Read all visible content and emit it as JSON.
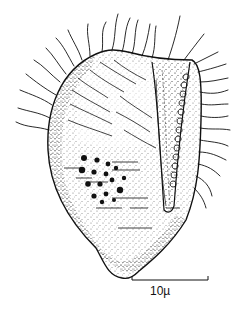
{
  "figure": {
    "colors": {
      "ink": "#111111",
      "background": "#ffffff"
    },
    "scale_bar": {
      "label": "10µ",
      "length_px": 76
    }
  }
}
